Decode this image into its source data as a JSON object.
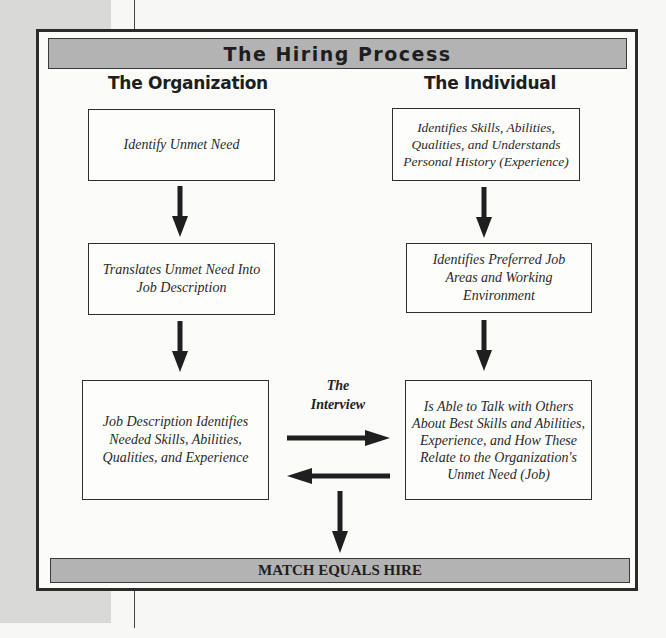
{
  "diagram": {
    "title": "The Hiring Process",
    "columns": {
      "organization": {
        "heading": "The Organization",
        "steps": [
          "Identify Unmet Need",
          "Translates Unmet Need Into Job Description",
          "Job Description Identifies Needed Skills, Abilities, Qualities, and Experience"
        ]
      },
      "individual": {
        "heading": "The Individual",
        "steps": [
          "Identifies Skills, Abilities, Qualities, and Understands Personal History (Experience)",
          "Identifies Preferred Job Areas and Working Environment",
          "Is Able to Talk with Others About Best Skills and Abilities, Experience, and How These Relate to the Organization's Unmet Need (Job)"
        ]
      }
    },
    "interview_label": "The Interview",
    "result": "MATCH EQUALS HIRE",
    "colors": {
      "bar_fill": "#b3b3b3",
      "border": "#2b2b2b",
      "arrow": "#1f1f1f",
      "side_strip": "#d9d9d8"
    }
  }
}
